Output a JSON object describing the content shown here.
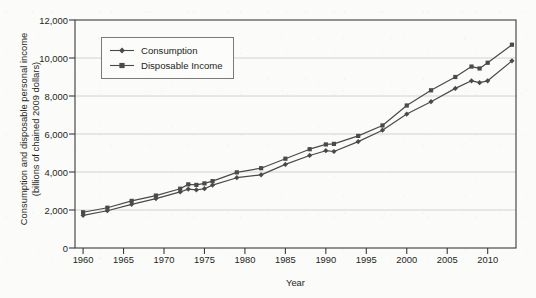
{
  "chart_data": {
    "type": "line",
    "title": "",
    "xlabel": "Year",
    "ylabel_line1": "Consumption and disposable personal income",
    "ylabel_line2": "(billions of chained 2009 dollars)",
    "xlim": [
      1959,
      2013.5
    ],
    "ylim": [
      0,
      12000
    ],
    "ytick_labels": [
      "0",
      "2,000",
      "4,000",
      "6,000",
      "8,000",
      "10,000",
      "12,000"
    ],
    "ytick_values": [
      0,
      2000,
      4000,
      6000,
      8000,
      10000,
      12000
    ],
    "xtick_labels": [
      "1960",
      "1965",
      "1970",
      "1975",
      "1980",
      "1985",
      "1990",
      "1995",
      "2000",
      "2005",
      "2010"
    ],
    "xtick_values": [
      1960,
      1965,
      1970,
      1975,
      1980,
      1985,
      1990,
      1995,
      2000,
      2005,
      2010
    ],
    "grid": "horizontal",
    "legend_position": "upper-left-inside",
    "line_color": "#4a4a4a",
    "grid_color": "#c9c9c9",
    "axis_color": "#3b3b3b",
    "series": [
      {
        "name": "Consumption",
        "marker": "diamond",
        "x": [
          1960,
          1963,
          1966,
          1969,
          1972,
          1973,
          1974,
          1975,
          1976,
          1979,
          1982,
          1985,
          1988,
          1990,
          1991,
          1994,
          1997,
          2000,
          2003,
          2006,
          2008,
          2009,
          2010,
          2013
        ],
        "values": [
          1720,
          1960,
          2300,
          2600,
          2950,
          3100,
          3060,
          3120,
          3310,
          3700,
          3850,
          4400,
          4870,
          5120,
          5080,
          5600,
          6200,
          7050,
          7700,
          8400,
          8800,
          8700,
          8800,
          9850
        ]
      },
      {
        "name": "Disposable Income",
        "marker": "square",
        "x": [
          1960,
          1963,
          1966,
          1969,
          1972,
          1973,
          1974,
          1975,
          1976,
          1979,
          1982,
          1985,
          1988,
          1990,
          1991,
          1994,
          1997,
          2000,
          2003,
          2006,
          2008,
          2009,
          2010,
          2013
        ],
        "values": [
          1880,
          2120,
          2480,
          2760,
          3120,
          3350,
          3320,
          3400,
          3520,
          3980,
          4200,
          4700,
          5200,
          5450,
          5480,
          5900,
          6450,
          7500,
          8300,
          9000,
          9550,
          9450,
          9750,
          10700
        ]
      }
    ]
  },
  "legend": {
    "items": [
      {
        "label": "Consumption"
      },
      {
        "label": "Disposable Income"
      }
    ]
  },
  "axes": {
    "x_title": "Year",
    "y_title_line1": "Consumption and disposable personal income",
    "y_title_line2": "(billions of chained 2009 dollars)"
  }
}
